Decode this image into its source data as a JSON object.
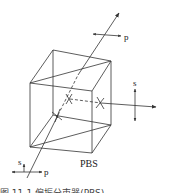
{
  "diagram": {
    "title": "PBS",
    "caption": "图 11-1  偏振分束器(PBS)",
    "labels": {
      "output_transmitted": "p",
      "output_reflected": "s",
      "input_s": "s",
      "input_p": "p",
      "component": "PBS"
    },
    "colors": {
      "line": "#333333",
      "background": "#ffffff"
    },
    "elements": [
      {
        "name": "cube",
        "type": "polarizing beam splitter cube"
      },
      {
        "name": "input-beam",
        "polarizations": [
          "s",
          "p"
        ]
      },
      {
        "name": "transmitted-beam",
        "polarization": "p"
      },
      {
        "name": "reflected-beam",
        "polarization": "s"
      }
    ]
  }
}
